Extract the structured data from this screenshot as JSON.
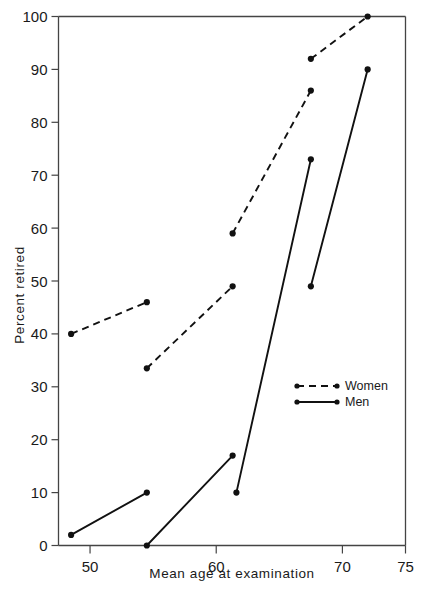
{
  "chart_data": {
    "type": "line",
    "title": "",
    "xlabel": "Mean age at examination",
    "ylabel": "Percent retired",
    "xlim": [
      47.5,
      75
    ],
    "ylim": [
      0,
      100
    ],
    "xticks": [
      50,
      60,
      70,
      75
    ],
    "xticklabels": [
      "50",
      "60",
      "70",
      "75"
    ],
    "yticks": [
      0,
      10,
      20,
      30,
      40,
      50,
      60,
      70,
      80,
      90,
      100
    ],
    "yticklabels": [
      "0",
      "10",
      "20",
      "30",
      "40",
      "50",
      "60",
      "70",
      "80",
      "90",
      "100"
    ],
    "grid": false,
    "legend_position": "center-right",
    "series": [
      {
        "name": "Women",
        "style": "dashed",
        "marker": "filled-circle",
        "color": "#111111",
        "segments": [
          {
            "points": [
              {
                "x": 48.5,
                "y": 40
              },
              {
                "x": 54.5,
                "y": 46
              }
            ]
          },
          {
            "points": [
              {
                "x": 54.5,
                "y": 33.5
              },
              {
                "x": 61.3,
                "y": 49
              }
            ]
          },
          {
            "points": [
              {
                "x": 61.3,
                "y": 59
              },
              {
                "x": 67.5,
                "y": 86
              }
            ]
          },
          {
            "points": [
              {
                "x": 67.5,
                "y": 92
              },
              {
                "x": 72.0,
                "y": 100
              }
            ]
          }
        ]
      },
      {
        "name": "Men",
        "style": "solid",
        "marker": "filled-circle",
        "color": "#111111",
        "segments": [
          {
            "points": [
              {
                "x": 48.5,
                "y": 2
              },
              {
                "x": 54.5,
                "y": 10
              }
            ]
          },
          {
            "points": [
              {
                "x": 54.5,
                "y": 0
              },
              {
                "x": 61.3,
                "y": 17
              }
            ]
          },
          {
            "points": [
              {
                "x": 61.6,
                "y": 10
              },
              {
                "x": 67.5,
                "y": 73
              }
            ]
          },
          {
            "points": [
              {
                "x": 67.5,
                "y": 49
              },
              {
                "x": 72.0,
                "y": 90
              }
            ]
          }
        ]
      }
    ]
  },
  "legend": {
    "entries": [
      {
        "label": "Women",
        "style": "dashed"
      },
      {
        "label": "Men",
        "style": "solid"
      }
    ]
  },
  "axes": {
    "x_title": "Mean age at examination",
    "y_title": "Percent retired"
  }
}
